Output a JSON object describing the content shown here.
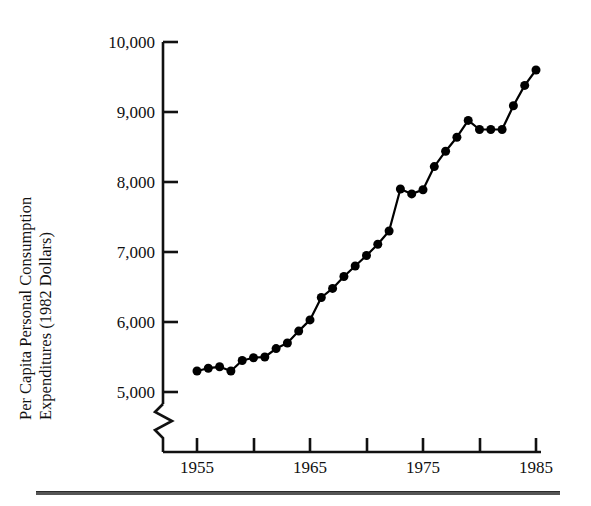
{
  "figure": {
    "background_color": "#ffffff",
    "ink_color": "#000000",
    "has_bottom_rule": true
  },
  "chart_data": {
    "type": "line",
    "title": "",
    "subtitle": "",
    "xlabel": "",
    "ylabel": "Per Capita Personal Consumption Expenditures (1982 Dollars)",
    "ylabel_line1": "Per Capita Personal Consumption",
    "ylabel_line2": "Expenditures (1982 Dollars)",
    "grid": false,
    "legend": null,
    "legend_position": "none",
    "axis_break_y": true,
    "axis_break_note": "zigzag break on y-axis below 5,000",
    "xlim": [
      1955,
      1985
    ],
    "ylim": [
      5000,
      10000
    ],
    "ytick_labels": [
      "10,000",
      "9,000",
      "8,000",
      "7,000",
      "6,000",
      "5,000"
    ],
    "ytick_values": [
      10000,
      9000,
      8000,
      7000,
      6000,
      5000
    ],
    "xtick_labels": [
      "1955",
      "1965",
      "1975",
      "1985"
    ],
    "xtick_values": [
      1955,
      1965,
      1975,
      1985
    ],
    "xtick_minor_values": [
      1960,
      1970,
      1980
    ],
    "marker": "filled-circle",
    "marker_size_px": 9,
    "line_width_px": 2.2,
    "series": [
      {
        "name": "Per Capita Personal Consumption Expenditures",
        "color": "#000000",
        "x": [
          1955,
          1956,
          1957,
          1958,
          1959,
          1960,
          1961,
          1962,
          1963,
          1964,
          1965,
          1966,
          1967,
          1968,
          1969,
          1970,
          1971,
          1972,
          1973,
          1974,
          1975,
          1976,
          1977,
          1978,
          1979,
          1980,
          1981,
          1982,
          1983,
          1984,
          1985
        ],
        "values": [
          5300,
          5340,
          5360,
          5300,
          5450,
          5490,
          5500,
          5620,
          5700,
          5870,
          6030,
          6350,
          6480,
          6650,
          6800,
          6950,
          7110,
          7300,
          7900,
          7830,
          7890,
          8220,
          8440,
          8640,
          8880,
          8750,
          8750,
          8750,
          9090,
          9380,
          9600
        ]
      }
    ]
  },
  "axes": {
    "y_ticks": [
      {
        "label": "10,000",
        "value": 10000
      },
      {
        "label": "9,000",
        "value": 9000
      },
      {
        "label": "8,000",
        "value": 8000
      },
      {
        "label": "7,000",
        "value": 7000
      },
      {
        "label": "6,000",
        "value": 6000
      },
      {
        "label": "5,000",
        "value": 5000
      }
    ],
    "x_ticks": [
      {
        "label": "1955",
        "value": 1955
      },
      {
        "label": "1965",
        "value": 1965
      },
      {
        "label": "1975",
        "value": 1975
      },
      {
        "label": "1985",
        "value": 1985
      }
    ]
  }
}
